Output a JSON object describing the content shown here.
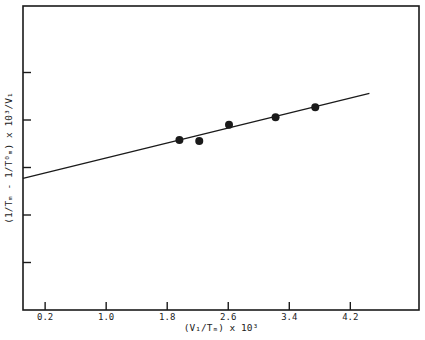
{
  "chart_data": {
    "type": "scatter",
    "title": "",
    "xlabel": "(V1/Tm) x 10^3",
    "ylabel": "(1/Tm - 1/T0m) x 10^3/V1",
    "xlabel_display": "(V₁/Tₘ) x 10³",
    "ylabel_display": "(1/Tₘ - 1/T⁰ₘ) x 10³/V₁",
    "x_ticks": [
      0.2,
      1.0,
      1.8,
      2.6,
      3.4,
      4.2
    ],
    "x_tick_labels": [
      "0.2",
      "1.0",
      "1.8",
      "2.6",
      "3.4",
      "4.2"
    ],
    "y_ticks": [
      1,
      2,
      3,
      4,
      5
    ],
    "y_tick_labels": [
      "",
      "",
      "",
      "",
      ""
    ],
    "xlim": [
      -0.09,
      5.1
    ],
    "ylim": [
      0,
      6.4
    ],
    "grid": false,
    "legend": null,
    "series": [
      {
        "name": "data",
        "type": "scatter",
        "marker": "filled-circle",
        "x": [
          1.96,
          2.22,
          2.61,
          3.22,
          3.74
        ],
        "y": [
          3.58,
          3.56,
          3.9,
          4.06,
          4.27
        ]
      },
      {
        "name": "fit",
        "type": "line",
        "x": [
          -0.09,
          4.45
        ],
        "y": [
          2.77,
          4.56
        ]
      }
    ],
    "colors": {
      "ink": "#1a1a1a",
      "background": "#ffffff"
    }
  }
}
